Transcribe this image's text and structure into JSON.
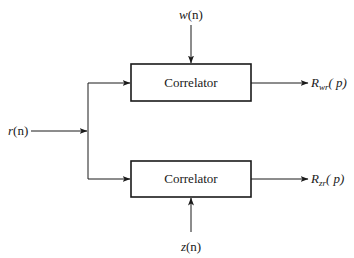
{
  "diagram": {
    "type": "block-diagram",
    "blocks": [
      {
        "id": "correlator-top",
        "label": "Correlator"
      },
      {
        "id": "correlator-bottom",
        "label": "Correlator"
      }
    ],
    "signals": {
      "input_main": {
        "name": "r",
        "arg": "(n)"
      },
      "input_top": {
        "name": "w",
        "arg": "(n)"
      },
      "input_bottom": {
        "name": "z",
        "arg": "(n)"
      },
      "output_top": {
        "name": "R",
        "sub": "wr",
        "arg": "( p)"
      },
      "output_bottom": {
        "name": "R",
        "sub": "zr",
        "arg": "( p)"
      }
    },
    "connections": [
      {
        "from": "r(n)",
        "to": "correlator-top"
      },
      {
        "from": "r(n)",
        "to": "correlator-bottom"
      },
      {
        "from": "w(n)",
        "to": "correlator-top"
      },
      {
        "from": "z(n)",
        "to": "correlator-bottom"
      },
      {
        "from": "correlator-top",
        "to": "R_wr(p)"
      },
      {
        "from": "correlator-bottom",
        "to": "R_zr(p)"
      }
    ]
  }
}
